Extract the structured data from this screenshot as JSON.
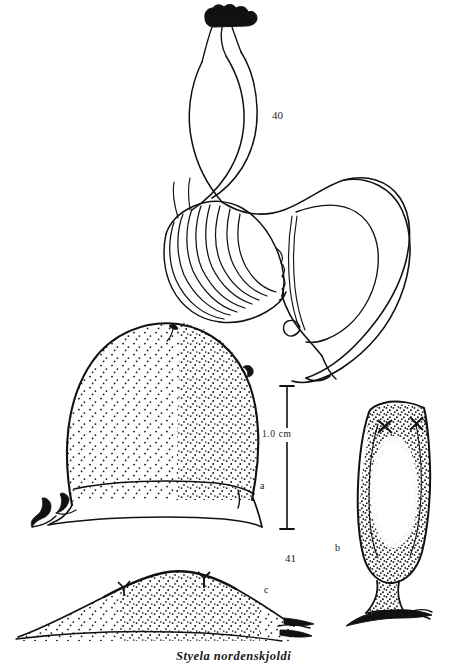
{
  "plate": {
    "caption": "Styela nordenskjoldi",
    "background_color": "#ffffff",
    "ink_color": "#111111",
    "width": 457,
    "height": 666
  },
  "figures": [
    {
      "id": "fig-40",
      "number": "40",
      "description": "internal anatomy: siphons with lobed crown, gonad lamellae, looped gut"
    },
    {
      "id": "fig-41",
      "number": "41",
      "description": "external views of whole animals, panels a, b, c"
    }
  ],
  "panels": [
    {
      "id": "a",
      "letter": "a",
      "description": "large dome-shaped specimen, dense stippling, flattened base with root processes"
    },
    {
      "id": "b",
      "letter": "b",
      "description": "elongate stalked specimen with two cross-shaped siphon apertures"
    },
    {
      "id": "c",
      "letter": "c",
      "description": "low flattened specimen in lateral view with two siphon apertures"
    }
  ],
  "scale_bar": {
    "label": "1.0  cm",
    "value": "1.0",
    "unit": "cm"
  }
}
